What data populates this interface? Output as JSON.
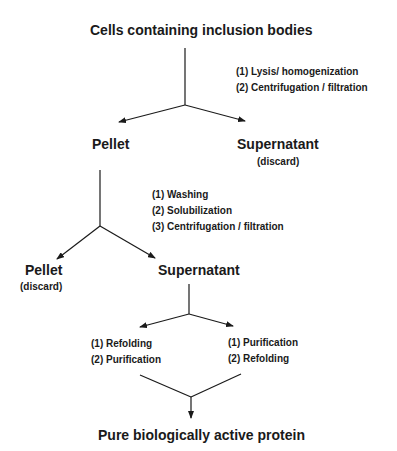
{
  "diagram": {
    "nodes": {
      "start": "Cells containing inclusion bodies",
      "pellet1": "Pellet",
      "supernatant1": "Supernatant",
      "supernatant1_note": "(discard)",
      "pellet2": "Pellet",
      "pellet2_note": "(discard)",
      "supernatant2": "Supernatant",
      "end": "Pure biologically active protein"
    },
    "steps": {
      "stage1": [
        "(1) Lysis/ homogenization",
        "(2) Centrifugation / filtration"
      ],
      "stage2": [
        "(1) Washing",
        "(2) Solubilization",
        "(3) Centrifugation / filtration"
      ],
      "branch_left": [
        "(1) Refolding",
        "(2) Purification"
      ],
      "branch_right": [
        "(1) Purification",
        "(2) Refolding"
      ]
    },
    "edges": [
      {
        "from": "start",
        "to": "pellet1"
      },
      {
        "from": "start",
        "to": "supernatant1"
      },
      {
        "from": "pellet1",
        "to": "pellet2"
      },
      {
        "from": "pellet1",
        "to": "supernatant2"
      },
      {
        "from": "supernatant2",
        "to": "branch_left"
      },
      {
        "from": "supernatant2",
        "to": "branch_right"
      },
      {
        "from": "branch_left",
        "to": "end"
      },
      {
        "from": "branch_right",
        "to": "end"
      }
    ],
    "colors": {
      "ink": "#1a1a1a",
      "background": "#ffffff"
    }
  }
}
